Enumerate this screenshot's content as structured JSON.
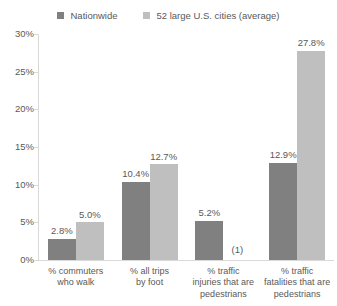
{
  "chart_data": {
    "type": "bar",
    "title": "",
    "subtitle": "",
    "xlabel": "",
    "ylabel": "",
    "ylim": [
      0,
      30
    ],
    "ytick_values": [
      30,
      25,
      20,
      15,
      10,
      5,
      0
    ],
    "ytick_labels": [
      "30%",
      "25%",
      "20%",
      "15%",
      "10%",
      "5%",
      "0%"
    ],
    "grid": false,
    "legend_position": "top",
    "categories": [
      "% commuters\nwho walk",
      "% all trips\nby foot",
      "% traffic\ninjuries that are\npedestrians",
      "% traffic\nfatalities that are\npedestrians"
    ],
    "series": [
      {
        "name": "Nationwide",
        "color": "#808080",
        "values": [
          2.8,
          10.4,
          5.2,
          12.9
        ],
        "labels": [
          "2.8%",
          "10.4%",
          "5.2%",
          "12.9%"
        ]
      },
      {
        "name": "52 large U.S. cities (average)",
        "color": "#bfbfbf",
        "values": [
          5.0,
          12.7,
          null,
          27.8
        ],
        "labels": [
          "5.0%",
          "12.7%",
          "",
          "27.8%"
        ]
      }
    ],
    "annotations": [
      {
        "text": "(1)",
        "category_index": 2,
        "series_index": 1,
        "note": "footnote marker where the 52-cities bar is absent"
      }
    ]
  },
  "legend": {
    "items": [
      {
        "label": "Nationwide",
        "color": "#808080"
      },
      {
        "label": "52 large U.S. cities (average)",
        "color": "#bfbfbf"
      }
    ]
  },
  "axis": {
    "line_color": "#d9d9d9",
    "text_color": "#595959"
  }
}
